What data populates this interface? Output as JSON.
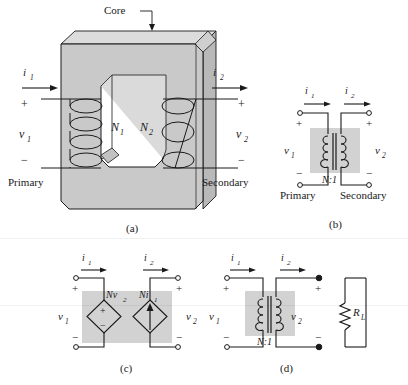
{
  "figure": {
    "title_label": "Core",
    "panels": [
      {
        "id": "a",
        "caption": "(a)",
        "kind": "physical-core-transformer",
        "labels": {
          "core": "Core",
          "i1": "i",
          "i1_sub": "1",
          "i2": "i",
          "i2_sub": "2",
          "v1": "v",
          "v1_sub": "1",
          "v2": "v",
          "v2_sub": "2",
          "n1": "N",
          "n1_sub": "1",
          "n2": "N",
          "n2_sub": "2",
          "plus_primary": "+",
          "minus_primary": "−",
          "plus_secondary": "+",
          "minus_secondary": "−",
          "primary": "Primary",
          "secondary": "Secondary"
        }
      },
      {
        "id": "b",
        "caption": "(b)",
        "kind": "ideal-transformer-symbol",
        "labels": {
          "i1": "i",
          "i1_sub": "1",
          "i2": "i",
          "i2_sub": "2",
          "v1": "v",
          "v1_sub": "1",
          "v2": "v",
          "v2_sub": "2",
          "ratio": "N:1",
          "plus_primary": "+",
          "minus_primary": "−",
          "plus_secondary": "+",
          "minus_secondary": "−",
          "primary": "Primary",
          "secondary": "Secondary"
        }
      },
      {
        "id": "c",
        "caption": "(c)",
        "kind": "dependent-source-equivalent",
        "labels": {
          "i1": "i",
          "i1_sub": "1",
          "i2": "i",
          "i2_sub": "2",
          "v1": "v",
          "v1_sub": "1",
          "v2": "v",
          "v2_sub": "2",
          "vsource": "Nv",
          "vsource_sub": "2",
          "isource": "Ni",
          "isource_sub": "1",
          "source_plus": "+",
          "source_minus": "−",
          "plus_primary": "+",
          "minus_primary": "−",
          "plus_secondary": "+",
          "minus_secondary": "−"
        }
      },
      {
        "id": "d",
        "caption": "(d)",
        "kind": "transformer-with-load",
        "labels": {
          "i1": "i",
          "i1_sub": "1",
          "i2": "i",
          "i2_sub": "2",
          "v1": "v",
          "v1_sub": "1",
          "v2": "v",
          "v2_sub": "2",
          "ratio": "N:1",
          "load": "R",
          "load_sub": "L",
          "plus_primary": "+",
          "minus_primary": "−",
          "plus_secondary": "+",
          "minus_secondary": "−"
        }
      }
    ]
  },
  "colors": {
    "line": "#1a1a1a",
    "core_face": "#c9c9c9",
    "core_top": "#dcdcdc",
    "core_side": "#b3b3b3",
    "shade_box": "#d2d2d2",
    "background": "#ffffff",
    "coil": "#3a3a3a"
  }
}
